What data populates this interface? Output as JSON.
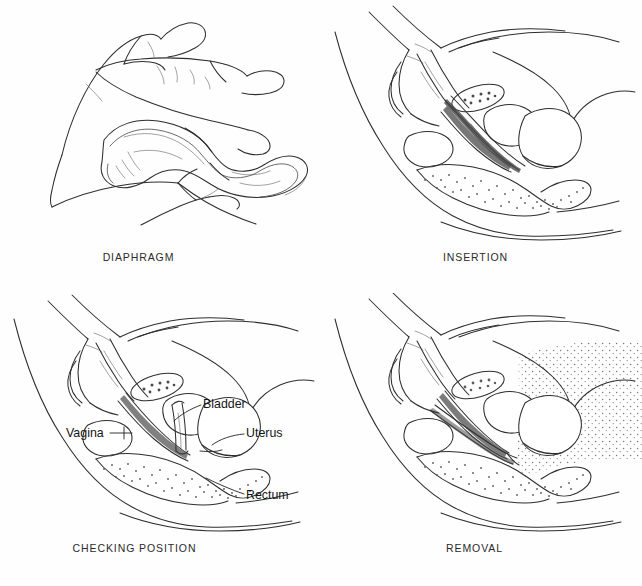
{
  "figure": {
    "background_color": "#fefefe",
    "ink_color": "#2e2e2e",
    "label_color": "#151515",
    "columns": 2,
    "rows": 2
  },
  "panels": [
    {
      "id": "diaphragm",
      "caption": "DIAPHRAGM",
      "subject": "hand pinching folded diaphragm",
      "icons": [
        "hand-icon",
        "diaphragm-ring-icon"
      ],
      "labels": []
    },
    {
      "id": "insertion",
      "caption": "INSERTION",
      "subject": "pelvic sagittal section with hand inserting diaphragm",
      "icons": [
        "hand-icon",
        "pelvis-sagittal-icon",
        "diaphragm-folded-icon"
      ],
      "labels": []
    },
    {
      "id": "checking",
      "caption": "CHECKING POSITION",
      "subject": "pelvic sagittal section with finger checking diaphragm over cervix",
      "icons": [
        "hand-icon",
        "pelvis-sagittal-icon",
        "diaphragm-in-place-icon"
      ],
      "labels": [
        {
          "text": "Bladder",
          "anchor": "bladder"
        },
        {
          "text": "Vagina",
          "anchor": "vagina"
        },
        {
          "text": "Uterus",
          "anchor": "uterus"
        },
        {
          "text": "Rectum",
          "anchor": "rectum"
        }
      ]
    },
    {
      "id": "removal",
      "caption": "REMOVAL",
      "subject": "pelvic sagittal section with finger hooking diaphragm rim for removal",
      "icons": [
        "hand-icon",
        "pelvis-sagittal-icon",
        "diaphragm-hooked-icon",
        "stipple-region-icon"
      ],
      "labels": []
    }
  ],
  "annotations": {
    "bladder": "Bladder",
    "vagina": "Vagina",
    "uterus": "Uterus",
    "rectum": "Rectum"
  }
}
